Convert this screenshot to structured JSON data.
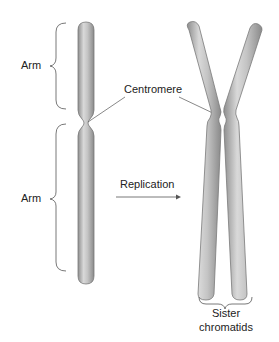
{
  "diagram": {
    "labels": {
      "arm_top": "Arm",
      "arm_bottom": "Arm",
      "centromere": "Centromere",
      "replication": "Replication",
      "sister_line1": "Sister",
      "sister_line2": "chromatids"
    },
    "colors": {
      "chromosome_fill": "#b8b8b8",
      "chromosome_highlight": "#e6e6e6",
      "chromosome_edge": "#7a7a7a",
      "line": "#555555",
      "text": "#222222"
    }
  }
}
